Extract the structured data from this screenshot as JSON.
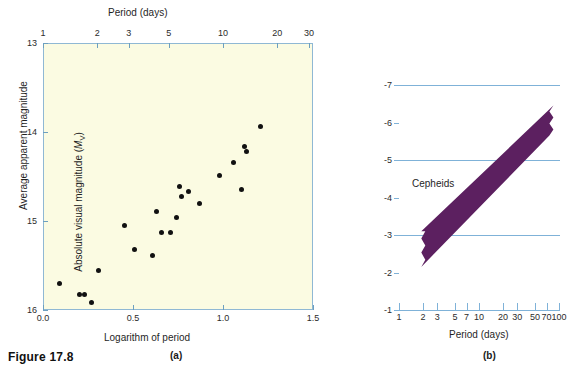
{
  "figure": {
    "caption": "Figure 17.8",
    "panel_a_letter": "(a)",
    "panel_b_letter": "(b)",
    "background_color": "#ffffff",
    "plot_fill_color": "#fbfbe2",
    "axis_color": "#8fb8d4",
    "band_color": "#5c2060",
    "dot_color": "#111111"
  },
  "chart_data": [
    {
      "id": "panel-a",
      "type": "scatter",
      "title": "",
      "xlabel": "Logarithm of period",
      "ylabel": "Average apparent magnitude",
      "top_axis_label": "Period (days)",
      "xlim": [
        0.0,
        1.5
      ],
      "ylim": [
        16,
        13
      ],
      "y_inverted": true,
      "grid": false,
      "legend": "none",
      "xticks": [
        0.0,
        0.5,
        1.0,
        1.5
      ],
      "xticklabels": [
        "0.0",
        "0.5",
        "1.0",
        "1.5"
      ],
      "yticks": [
        13,
        14,
        15,
        16
      ],
      "yticklabels": [
        "13",
        "14",
        "15",
        "16"
      ],
      "top_xticks_days": [
        1,
        2,
        3,
        5,
        10,
        20,
        30
      ],
      "top_xticklabels": [
        "1",
        "2",
        "3",
        "5",
        "10",
        "20",
        "30"
      ],
      "points": [
        {
          "x": 0.085,
          "y": 15.69
        },
        {
          "x": 0.195,
          "y": 15.82
        },
        {
          "x": 0.225,
          "y": 15.82
        },
        {
          "x": 0.265,
          "y": 15.9
        },
        {
          "x": 0.305,
          "y": 15.54
        },
        {
          "x": 0.445,
          "y": 15.04
        },
        {
          "x": 0.505,
          "y": 15.31
        },
        {
          "x": 0.605,
          "y": 15.38
        },
        {
          "x": 0.625,
          "y": 14.88
        },
        {
          "x": 0.655,
          "y": 15.12
        },
        {
          "x": 0.705,
          "y": 15.12
        },
        {
          "x": 0.735,
          "y": 14.95
        },
        {
          "x": 0.755,
          "y": 14.6
        },
        {
          "x": 0.765,
          "y": 14.71
        },
        {
          "x": 0.805,
          "y": 14.66
        },
        {
          "x": 0.865,
          "y": 14.79
        },
        {
          "x": 0.975,
          "y": 14.48
        },
        {
          "x": 1.055,
          "y": 14.33
        },
        {
          "x": 1.095,
          "y": 14.63
        },
        {
          "x": 1.115,
          "y": 14.15
        },
        {
          "x": 1.125,
          "y": 14.21
        },
        {
          "x": 1.205,
          "y": 13.93
        }
      ]
    },
    {
      "id": "panel-b",
      "type": "area",
      "title": "",
      "xlabel": "Period (days)",
      "ylabel": "Absolute visual magnitude (Mv)",
      "annotation": "Cepheids",
      "x_scale": "log",
      "xlim": [
        1,
        100
      ],
      "ylim": [
        -1,
        -7
      ],
      "y_inverted": true,
      "grid": true,
      "gridlines_at": [
        -7,
        -5,
        -3
      ],
      "legend": "none",
      "xticks": [
        1,
        2,
        3,
        5,
        7,
        10,
        20,
        30,
        50,
        70,
        100
      ],
      "xticklabels": [
        "1",
        "2",
        "3",
        "5",
        "7",
        "10",
        "20",
        "30",
        "50",
        "70",
        "100"
      ],
      "yticks": [
        -1,
        -2,
        -3,
        -4,
        -5,
        -6,
        -7
      ],
      "yticklabels": [
        "-1",
        "-2",
        "-3",
        "-4",
        "-5",
        "-6",
        "-7"
      ],
      "band": {
        "label": "Cepheids",
        "x_start_days": 1.9,
        "x_end_days": 85,
        "y_lower_at_start": -2.15,
        "y_upper_at_start": -3.1,
        "y_lower_at_end": -5.65,
        "y_upper_at_end": -6.45,
        "description": "Period-luminosity relation band for Cepheid variables"
      }
    }
  ],
  "panel_a": {
    "top_axis_title": "Period (days)",
    "x_axis_title": "Logarithm of period",
    "y_axis_title": "Average apparent magnitude",
    "top_ticks": [
      "1",
      "2",
      "3",
      "5",
      "10",
      "20",
      "30"
    ],
    "bottom_ticks": [
      "0.0",
      "0.5",
      "1.0",
      "1.5"
    ],
    "left_ticks": [
      "13",
      "14",
      "15",
      "16"
    ]
  },
  "panel_b": {
    "x_axis_title": "Period (days)",
    "y_axis_title_main": "Absolute visual magnitude (",
    "y_axis_title_italic": "M",
    "y_axis_title_sub": "V",
    "y_axis_title_close": ")",
    "band_label": "Cepheids",
    "bottom_ticks": [
      "1",
      "2",
      "3",
      "5",
      "7",
      "10",
      "20",
      "30",
      "50",
      "70",
      "100"
    ],
    "left_ticks": [
      "-7",
      "-6",
      "-5",
      "-4",
      "-3",
      "-2",
      "-1"
    ]
  }
}
